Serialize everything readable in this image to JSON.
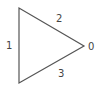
{
  "diagram": {
    "shape": "triangle",
    "stroke_color": "#555555",
    "vertices": [
      [
        19,
        8
      ],
      [
        19,
        83
      ],
      [
        84,
        46
      ]
    ],
    "labels": {
      "left_edge": "1",
      "top_edge": "2",
      "bottom_edge": "3",
      "apex": "0"
    }
  }
}
